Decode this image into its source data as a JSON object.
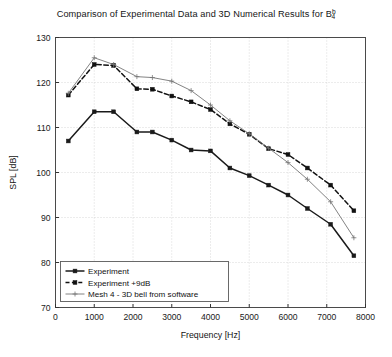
{
  "chart_data": {
    "type": "line",
    "title": "Comparison of Experimental Data and 3D Numerical Results for B",
    "title_sub": "4",
    "title_sup": "b",
    "xlabel": "Frequency [Hz]",
    "ylabel": "SPL [dB]",
    "xlim": [
      0,
      8000
    ],
    "ylim": [
      70,
      130
    ],
    "xticks": [
      0,
      1000,
      2000,
      3000,
      4000,
      5000,
      6000,
      7000,
      8000
    ],
    "xtick_labels": [
      "0",
      "1000",
      "2000",
      "3000",
      "4000",
      "5000",
      "6000",
      "7000",
      "8000"
    ],
    "yticks": [
      70,
      80,
      90,
      100,
      110,
      120,
      130
    ],
    "ytick_labels": [
      "70",
      "80",
      "90",
      "100",
      "110",
      "120",
      "130"
    ],
    "grid": true,
    "grid_style": "dotted",
    "legend_position": "lower left",
    "series": [
      {
        "name": "Experiment",
        "style": "solid",
        "color": "#1a1a1a",
        "marker": "square",
        "linewidth": 1.5,
        "x": [
          330,
          1000,
          1500,
          2100,
          2500,
          3000,
          3500,
          4000,
          4500,
          5000,
          5500,
          6000,
          6500,
          7100,
          7700
        ],
        "y": [
          107.0,
          113.5,
          113.5,
          109.0,
          109.0,
          107.2,
          105.0,
          104.8,
          101.0,
          99.3,
          97.2,
          95.0,
          92.0,
          88.5,
          81.5
        ]
      },
      {
        "name": "Experiment +9dB",
        "style": "dashed",
        "color": "#111111",
        "marker": "square",
        "linewidth": 1.5,
        "x": [
          330,
          1000,
          1500,
          2100,
          2500,
          3000,
          3500,
          4000,
          4500,
          5000,
          5500,
          6000,
          6500,
          7100,
          7700
        ],
        "y": [
          117.2,
          124.0,
          123.8,
          118.6,
          118.5,
          117.0,
          115.7,
          114.0,
          110.8,
          108.5,
          105.3,
          104.0,
          101.0,
          97.2,
          91.5
        ]
      },
      {
        "name": "Mesh 4 - 3D bell from software",
        "style": "solid",
        "color": "#757575",
        "marker": "plus",
        "linewidth": 0.9,
        "x": [
          330,
          1000,
          1500,
          2100,
          2500,
          3000,
          3500,
          4000,
          4500,
          5000,
          5500,
          6000,
          6500,
          7100,
          7700
        ],
        "y": [
          117.6,
          125.5,
          124.0,
          121.3,
          121.1,
          120.3,
          118.2,
          115.0,
          111.5,
          108.6,
          105.4,
          102.2,
          98.5,
          93.5,
          85.5
        ]
      }
    ]
  },
  "legend": {
    "items": [
      {
        "label": "Experiment"
      },
      {
        "label": "Experiment +9dB"
      },
      {
        "label": "Mesh 4 - 3D bell from software"
      }
    ]
  }
}
